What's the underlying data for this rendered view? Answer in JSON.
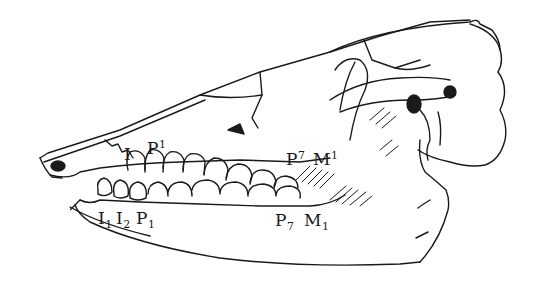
{
  "figure": {
    "ink_color": "#1a1a1a",
    "background": "#ffffff"
  },
  "labels": {
    "upper_incisor": {
      "base": "I",
      "index": ""
    },
    "upper_premolar_first": {
      "base": "P",
      "index": "1"
    },
    "upper_premolar_last": {
      "base": "P",
      "index": "7"
    },
    "upper_molar_first": {
      "base": "M",
      "index": "1"
    },
    "lower_incisor_1": {
      "base": "I",
      "index": "1"
    },
    "lower_incisor_2": {
      "base": "I",
      "index": "2"
    },
    "lower_premolar_first": {
      "base": "P",
      "index": "1"
    },
    "lower_premolar_last": {
      "base": "P",
      "index": "7"
    },
    "lower_molar_first": {
      "base": "M",
      "index": "1"
    }
  }
}
